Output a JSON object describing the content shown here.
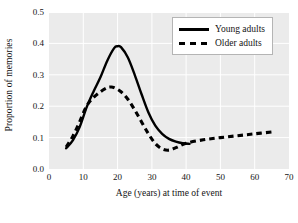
{
  "chart_data": {
    "type": "line",
    "title": "",
    "xlabel": "Age (years) at time of event",
    "ylabel": "Proportion of memories",
    "xlim": [
      0,
      70
    ],
    "ylim": [
      0.0,
      0.5
    ],
    "xticks": [
      0,
      10,
      20,
      30,
      40,
      50,
      60,
      70
    ],
    "xticklabels": [
      "0",
      "10",
      "20",
      "30",
      "40",
      "50",
      "60",
      "70"
    ],
    "yticks": [
      0.0,
      0.1,
      0.2,
      0.3,
      0.4,
      0.5
    ],
    "yticklabels": [
      "0.0",
      "0.1",
      "0.2",
      "0.3",
      "0.4",
      "0.5"
    ],
    "grid": true,
    "legend_position": "top-right",
    "plot_background": "#ebebeb",
    "grid_color": "#ffffff",
    "line_color": "#000000",
    "series": [
      {
        "name": "Young adults",
        "style": "solid",
        "x": [
          5,
          7,
          9,
          11,
          13,
          15,
          17,
          19,
          20,
          21,
          23,
          25,
          27,
          29,
          31,
          33,
          35,
          37,
          39,
          41
        ],
        "y": [
          0.066,
          0.092,
          0.135,
          0.197,
          0.247,
          0.292,
          0.345,
          0.385,
          0.391,
          0.388,
          0.355,
          0.3,
          0.238,
          0.18,
          0.138,
          0.112,
          0.096,
          0.087,
          0.082,
          0.08
        ]
      },
      {
        "name": "Older adults",
        "style": "dashed",
        "x": [
          5,
          7,
          9,
          11,
          13,
          15,
          17,
          18,
          19,
          21,
          23,
          25,
          27,
          29,
          31,
          33,
          35,
          37,
          40,
          45,
          50,
          55,
          60,
          65
        ],
        "y": [
          0.07,
          0.105,
          0.152,
          0.201,
          0.228,
          0.246,
          0.259,
          0.261,
          0.259,
          0.246,
          0.222,
          0.188,
          0.15,
          0.112,
          0.081,
          0.064,
          0.06,
          0.068,
          0.082,
          0.093,
          0.1,
          0.106,
          0.112,
          0.118
        ]
      }
    ]
  },
  "legend": {
    "items": [
      {
        "label": "Young adults",
        "style": "solid"
      },
      {
        "label": "Older adults",
        "style": "dashed"
      }
    ]
  }
}
